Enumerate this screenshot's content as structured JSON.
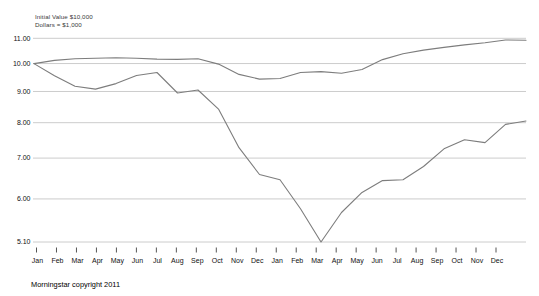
{
  "footer": {
    "copyright": "Morningstar copyright 2011"
  },
  "chart_data": {
    "type": "line",
    "annotations": [
      "Initial Value $10,000",
      "Dollars = $1,000"
    ],
    "y_scale": "log",
    "ylim": [
      5.1,
      11.0
    ],
    "grid": true,
    "legend": "none",
    "y_tick_labels": [
      "11.00",
      "10.00",
      "9.00",
      "8.00",
      "7.00",
      "6.00",
      "5.10"
    ],
    "y_tick_values": [
      11.0,
      10.0,
      9.0,
      8.0,
      7.0,
      6.0,
      5.1
    ],
    "x_tick_labels": [
      "Jan",
      "Feb",
      "Mar",
      "Apr",
      "May",
      "Jun",
      "Jul",
      "Aug",
      "Sep",
      "Oct",
      "Nov",
      "Dec",
      "Jan",
      "Feb",
      "Mar",
      "Apr",
      "May",
      "Jun",
      "Jul",
      "Aug",
      "Sep",
      "Oct",
      "Nov",
      "Dec"
    ],
    "series_note": "first value is the initial value at the left edge; the following 24 values are month-end values over two years",
    "series": [
      {
        "name": "upper-fund-line",
        "color": "#7d7d7d",
        "values": [
          10.0,
          10.12,
          10.18,
          10.2,
          10.22,
          10.2,
          10.17,
          10.16,
          10.18,
          9.98,
          9.6,
          9.43,
          9.45,
          9.67,
          9.7,
          9.64,
          9.78,
          10.15,
          10.38,
          10.52,
          10.63,
          10.73,
          10.82,
          10.93,
          10.92
        ]
      },
      {
        "name": "lower-fund-line",
        "color": "#7d7d7d",
        "values": [
          10.0,
          9.55,
          9.18,
          9.08,
          9.27,
          9.56,
          9.67,
          8.95,
          9.05,
          8.42,
          7.28,
          6.58,
          6.45,
          5.78,
          5.1,
          5.7,
          6.15,
          6.43,
          6.45,
          6.78,
          7.25,
          7.5,
          7.42,
          7.95,
          8.05
        ]
      }
    ],
    "grid_color": "#cccccc",
    "tick_color": "#555555"
  }
}
